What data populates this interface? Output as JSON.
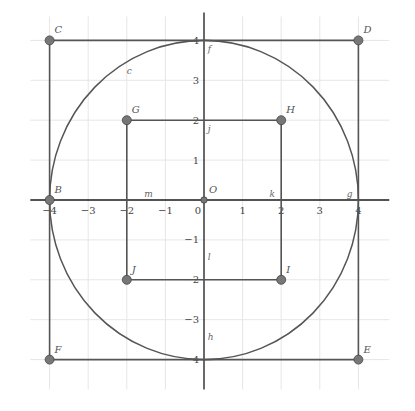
{
  "diagram": {
    "type": "coordinate-geometry",
    "origin_px": {
      "x": 204,
      "y": 200
    },
    "unit_px": {
      "x": 38.6,
      "y": 39.9
    },
    "grid": {
      "x_range": [
        -4.5,
        4.8
      ],
      "y_range": [
        -4.75,
        4.6
      ],
      "gridline_color": "#e6e6e6",
      "axis_color": "#1a1a1a"
    },
    "x_ticks": [
      {
        "value": -4,
        "label": "-4"
      },
      {
        "value": -3,
        "label": "-3"
      },
      {
        "value": -2,
        "label": "-2"
      },
      {
        "value": -1,
        "label": "-1"
      },
      {
        "value": 0,
        "label": "0"
      },
      {
        "value": 1,
        "label": "1"
      },
      {
        "value": 2,
        "label": "2"
      },
      {
        "value": 3,
        "label": "3"
      },
      {
        "value": 4,
        "label": "4"
      }
    ],
    "y_ticks": [
      {
        "value": 4,
        "label": "4"
      },
      {
        "value": 3,
        "label": "3"
      },
      {
        "value": 2,
        "label": "2"
      },
      {
        "value": 1,
        "label": "1"
      },
      {
        "value": -1,
        "label": "-1"
      },
      {
        "value": -2,
        "label": "-2"
      },
      {
        "value": -3,
        "label": "-3"
      },
      {
        "value": -4,
        "label": "-4"
      }
    ],
    "points": [
      {
        "name": "C",
        "x": -4,
        "y": 4
      },
      {
        "name": "D",
        "x": 4,
        "y": 4
      },
      {
        "name": "E",
        "x": 4,
        "y": -4
      },
      {
        "name": "F",
        "x": -4,
        "y": -4
      },
      {
        "name": "B",
        "x": -4,
        "y": 0
      },
      {
        "name": "G",
        "x": -2,
        "y": 2
      },
      {
        "name": "H",
        "x": 2,
        "y": 2
      },
      {
        "name": "I",
        "x": 2,
        "y": -2
      },
      {
        "name": "J",
        "x": -2,
        "y": -2
      },
      {
        "name": "O",
        "x": 0,
        "y": 0
      }
    ],
    "point_color": "#777777",
    "line_color": "#555555",
    "circle": {
      "name": "c",
      "center": "O",
      "radius": 4,
      "label_pos": {
        "x": -2.0,
        "y": 3.15
      }
    },
    "outer_square": [
      "C",
      "D",
      "E",
      "F"
    ],
    "inner_square": [
      "G",
      "H",
      "I",
      "J"
    ],
    "segment_labels": [
      {
        "name": "f",
        "x": 0.1,
        "y": 3.7
      },
      {
        "name": "j",
        "x": 0.1,
        "y": 1.7
      },
      {
        "name": "l",
        "x": 0.1,
        "y": -1.5
      },
      {
        "name": "h",
        "x": 0.1,
        "y": -3.5
      },
      {
        "name": "m",
        "x": -1.55,
        "y": 0.08
      },
      {
        "name": "k",
        "x": 1.7,
        "y": 0.08
      },
      {
        "name": "g",
        "x": 3.7,
        "y": 0.08
      }
    ]
  }
}
